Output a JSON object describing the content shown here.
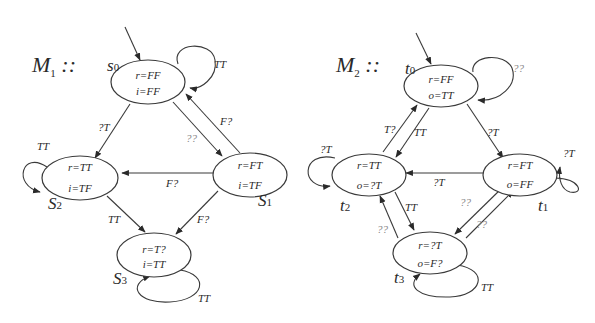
{
  "machines": [
    {
      "title": "M",
      "title_sub": "1",
      "title_suffix": " ::",
      "states": [
        {
          "id": "s0",
          "name": "s",
          "sub": "0",
          "line1": "r=FF",
          "line2": "i=FF"
        },
        {
          "id": "s1",
          "name": "S",
          "sub": "1",
          "line1": "r=FT",
          "line2": "i=TF"
        },
        {
          "id": "s2",
          "name": "S",
          "sub": "2",
          "line1": "r=TT",
          "line2": "i=TF"
        },
        {
          "id": "s3",
          "name": "S",
          "sub": "3",
          "line1": "r=T?",
          "line2": "i=TT"
        }
      ],
      "edges": [
        {
          "from": "init",
          "to": "s0",
          "label": ""
        },
        {
          "from": "s0",
          "to": "s0",
          "label": "TT"
        },
        {
          "from": "s0",
          "to": "s2",
          "label": "?T"
        },
        {
          "from": "s0",
          "to": "s1",
          "label": "??"
        },
        {
          "from": "s1",
          "to": "s0",
          "label": "F?"
        },
        {
          "from": "s1",
          "to": "s2",
          "label": "F?"
        },
        {
          "from": "s2",
          "to": "s2",
          "label": "TT"
        },
        {
          "from": "s2",
          "to": "s3",
          "label": "TT"
        },
        {
          "from": "s1",
          "to": "s3",
          "label": "F?"
        },
        {
          "from": "s3",
          "to": "s3",
          "label": "TT"
        }
      ]
    },
    {
      "title": "M",
      "title_sub": "2",
      "title_suffix": " ::",
      "states": [
        {
          "id": "t0",
          "name": "t",
          "sub": "0",
          "line1": "r=FF",
          "line2": "o=TT"
        },
        {
          "id": "t1",
          "name": "t",
          "sub": "1",
          "line1": "r=FT",
          "line2": "o=FF"
        },
        {
          "id": "t2",
          "name": "t",
          "sub": "2",
          "line1": "r=TT",
          "line2": "o=?T"
        },
        {
          "id": "t3",
          "name": "t",
          "sub": "3",
          "line1": "r=?T",
          "line2": "o=F?"
        }
      ],
      "edges": [
        {
          "from": "init",
          "to": "t0",
          "label": ""
        },
        {
          "from": "t0",
          "to": "t0",
          "label": "??"
        },
        {
          "from": "t2",
          "to": "t0",
          "label": "T?"
        },
        {
          "from": "t0",
          "to": "t2",
          "label": "TT"
        },
        {
          "from": "t0",
          "to": "t1",
          "label": "?T"
        },
        {
          "from": "t1",
          "to": "t1",
          "label": "?T"
        },
        {
          "from": "t1",
          "to": "t2",
          "label": "?T"
        },
        {
          "from": "t2",
          "to": "t2",
          "label": "?T"
        },
        {
          "from": "t2",
          "to": "t3",
          "label": "TT"
        },
        {
          "from": "t3",
          "to": "t2",
          "label": "??"
        },
        {
          "from": "t1",
          "to": "t3",
          "label": "??"
        },
        {
          "from": "t3",
          "to": "t1",
          "label": "??"
        },
        {
          "from": "t3",
          "to": "t3",
          "label": "TT"
        }
      ]
    }
  ]
}
